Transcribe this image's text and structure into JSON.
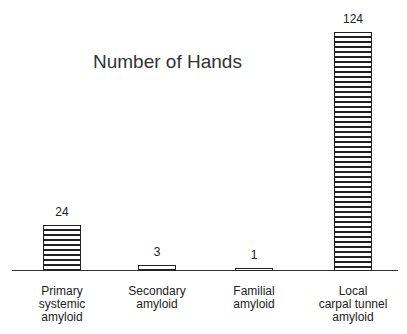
{
  "chart_data": {
    "type": "bar",
    "title": "Number of Hands",
    "categories": [
      "Primary systemic amyloid",
      "Secondary amyloid",
      "Familial amyloid",
      "Local carpal tunnel amyloid"
    ],
    "category_lines": [
      [
        "Primary",
        "systemic",
        "amyloid"
      ],
      [
        "Secondary",
        "amyloid"
      ],
      [
        "Familial",
        "amyloid"
      ],
      [
        "Local",
        "carpal tunnel",
        "amyloid"
      ]
    ],
    "values": [
      24,
      3,
      1,
      124
    ],
    "value_labels": [
      "24",
      "3",
      "1",
      "124"
    ],
    "xlabel": "",
    "ylabel": "",
    "ylim": [
      0,
      124
    ],
    "grid": false,
    "legend": null,
    "bar_fill": "horizontal-hatch"
  }
}
